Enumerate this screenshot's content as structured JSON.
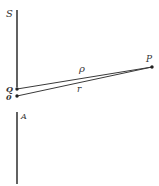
{
  "diagram": {
    "type": "geometry",
    "colors": {
      "stroke": "#3a3a3a",
      "text": "#333333",
      "background": "#ffffff"
    },
    "labels": {
      "screen_top": "S",
      "screen_bottom": "A",
      "point_q": "Q",
      "point_o": "0",
      "point_p": "P",
      "distance_qp": "ρ",
      "distance_op": "r"
    },
    "points": {
      "Q": [
        17,
        89
      ],
      "O": [
        17,
        96
      ],
      "P": [
        152,
        67
      ]
    },
    "segments": [
      {
        "name": "screen-upper",
        "from": [
          17,
          10
        ],
        "to": [
          17,
          87
        ]
      },
      {
        "name": "screen-lower",
        "from": [
          17,
          112
        ],
        "to": [
          17,
          184
        ]
      },
      {
        "name": "rho",
        "from": "Q",
        "to": "P"
      },
      {
        "name": "r",
        "from": "O",
        "to": "P"
      }
    ]
  }
}
